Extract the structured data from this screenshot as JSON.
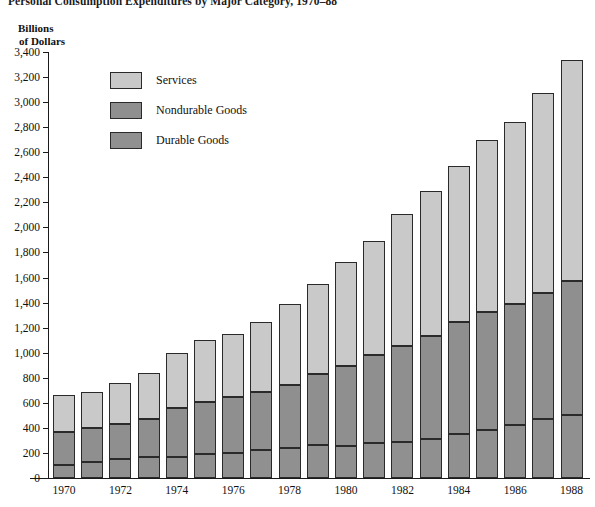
{
  "chart_data": {
    "type": "bar",
    "stacked": true,
    "title": "Personal Consumption Expenditures by Major Category, 1970–88",
    "ylabel_line1": "Billions",
    "ylabel_line2": "of Dollars",
    "xlabel": "",
    "ylim": [
      0,
      3400
    ],
    "ytick_step": 200,
    "grid": false,
    "legend_position": "upper-left-inside",
    "yticks": [
      "3,400",
      "3,200",
      "3,000",
      "2,800",
      "2,600",
      "2,400",
      "2,200",
      "2,000",
      "1,800",
      "1,600",
      "1,400",
      "1,200",
      "1,000",
      "800",
      "600",
      "400",
      "200",
      "0"
    ],
    "ytick_values": [
      3400,
      3200,
      3000,
      2800,
      2600,
      2400,
      2200,
      2000,
      1800,
      1600,
      1400,
      1200,
      1000,
      800,
      600,
      400,
      200,
      0
    ],
    "categories": [
      "1970",
      "1971",
      "1972",
      "1973",
      "1974",
      "1975",
      "1976",
      "1977",
      "1978",
      "1979",
      "1980",
      "1981",
      "1982",
      "1983",
      "1984",
      "1985",
      "1986",
      "1987",
      "1988"
    ],
    "xtick_labels": [
      "1970",
      "1972",
      "1974",
      "1976",
      "1978",
      "1980",
      "1982",
      "1984",
      "1986",
      "1988"
    ],
    "series": [
      {
        "name": "Durable Goods",
        "color": "#909090",
        "values": [
          105,
          130,
          150,
          170,
          170,
          190,
          200,
          225,
          240,
          260,
          255,
          280,
          290,
          315,
          355,
          385,
          420,
          470,
          500
        ]
      },
      {
        "name": "Nondurable Goods",
        "color": "#8f8f8f",
        "values": [
          265,
          270,
          285,
          300,
          390,
          415,
          445,
          465,
          500,
          570,
          640,
          705,
          760,
          815,
          890,
          940,
          970,
          1010,
          1070
        ]
      },
      {
        "name": "Services",
        "color": "#c9c9c9",
        "values": [
          290,
          290,
          325,
          370,
          440,
          495,
          505,
          555,
          645,
          720,
          830,
          910,
          1055,
          1160,
          1245,
          1370,
          1455,
          1595,
          1770
        ]
      }
    ],
    "totals": [
      660,
      690,
      760,
      840,
      1000,
      1100,
      1150,
      1245,
      1385,
      1550,
      1725,
      1895,
      2105,
      2290,
      2490,
      2695,
      2845,
      3075,
      3340
    ]
  }
}
